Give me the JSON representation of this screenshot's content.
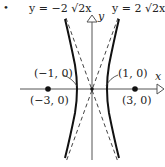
{
  "figure": {
    "bullet": "•",
    "asymptote_left_label": "y = −2 √2x",
    "asymptote_right_label": "y = 2 √2x",
    "axis_y_label": "y",
    "axis_x_label": "x",
    "vertex_left_label": "(−1, 0)",
    "vertex_right_label": "(1, 0)",
    "focus_left_label": "(−3, 0)",
    "focus_right_label": "(3, 0)"
  }
}
